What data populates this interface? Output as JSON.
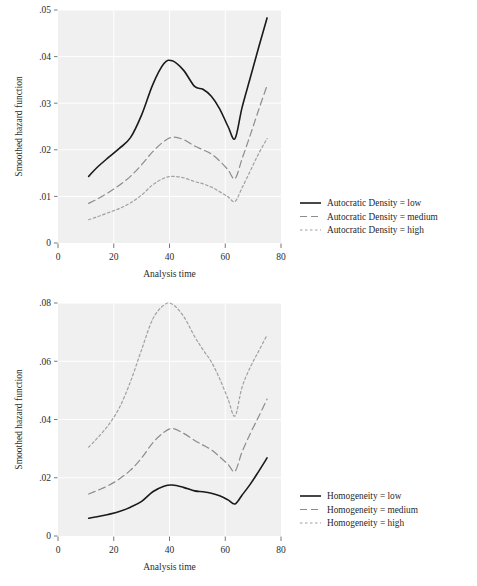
{
  "figure_top": {
    "name": "autocratic-density-hazard-chart",
    "chart_data": {
      "type": "line",
      "title": "",
      "xlabel": "Analysis time",
      "ylabel": "Smoothed hazard function",
      "xlim": [
        0,
        80
      ],
      "ylim": [
        0,
        0.05
      ],
      "xticks": [
        0,
        20,
        40,
        60,
        80
      ],
      "xtick_labels": [
        "0",
        "20",
        "40",
        "60",
        "80"
      ],
      "yticks": [
        0,
        0.01,
        0.02,
        0.03,
        0.04,
        0.05
      ],
      "ytick_labels": [
        "0",
        ".01",
        ".02",
        ".03",
        ".04",
        ".05"
      ],
      "grid": true,
      "grid_color": "#ffffff",
      "plot_background": "#f0f0f0",
      "legend_position": "right",
      "series": [
        {
          "name": "Autocratic Density = low",
          "style": "solid",
          "color": "#1a1a1a",
          "x": [
            11,
            14,
            18,
            22,
            26,
            30,
            34,
            38,
            41,
            45,
            49,
            52,
            55,
            58,
            61,
            63.5,
            66,
            69,
            72,
            75
          ],
          "values": [
            0.0143,
            0.0162,
            0.0183,
            0.0203,
            0.0226,
            0.0275,
            0.034,
            0.0385,
            0.0391,
            0.0371,
            0.0336,
            0.033,
            0.0315,
            0.0288,
            0.025,
            0.0224,
            0.029,
            0.0355,
            0.042,
            0.0483
          ]
        },
        {
          "name": "Autocratic Density = medium",
          "style": "dashed",
          "color": "#8c8c8c",
          "x": [
            11,
            14,
            18,
            22,
            26,
            30,
            34,
            38,
            41,
            45,
            49,
            52,
            55,
            58,
            61,
            63.5,
            66,
            69,
            72,
            75
          ],
          "values": [
            0.0085,
            0.0094,
            0.0108,
            0.0124,
            0.0143,
            0.0168,
            0.0196,
            0.0218,
            0.0227,
            0.0222,
            0.0208,
            0.02,
            0.0191,
            0.0176,
            0.0157,
            0.0138,
            0.018,
            0.0232,
            0.0286,
            0.0338
          ]
        },
        {
          "name": "Autocratic Density = high",
          "style": "dotted",
          "color": "#a0a0a0",
          "x": [
            11,
            14,
            18,
            22,
            26,
            30,
            34,
            38,
            41,
            45,
            49,
            52,
            55,
            58,
            61,
            63.5,
            66,
            69,
            72,
            75
          ],
          "values": [
            0.005,
            0.0056,
            0.0065,
            0.0074,
            0.0086,
            0.0103,
            0.0125,
            0.0139,
            0.0143,
            0.014,
            0.0132,
            0.0127,
            0.012,
            0.011,
            0.0099,
            0.0089,
            0.0118,
            0.0155,
            0.0192,
            0.0224
          ]
        }
      ]
    }
  },
  "figure_bottom": {
    "name": "homogeneity-hazard-chart",
    "chart_data": {
      "type": "line",
      "title": "",
      "xlabel": "Analysis time",
      "ylabel": "Smoothed hazard function",
      "xlim": [
        0,
        80
      ],
      "ylim": [
        0,
        0.08
      ],
      "xticks": [
        0,
        20,
        40,
        60,
        80
      ],
      "xtick_labels": [
        "0",
        "20",
        "40",
        "60",
        "80"
      ],
      "yticks": [
        0,
        0.02,
        0.04,
        0.06,
        0.08
      ],
      "ytick_labels": [
        "0",
        ".02",
        ".04",
        ".06",
        ".08"
      ],
      "grid": true,
      "grid_color": "#ffffff",
      "plot_background": "#f0f0f0",
      "legend_position": "right",
      "series": [
        {
          "name": "Homogeneity = low",
          "style": "solid",
          "color": "#1a1a1a",
          "x": [
            11,
            14,
            18,
            22,
            26,
            30,
            34,
            38,
            41,
            45,
            49,
            52,
            55,
            58,
            61,
            63.5,
            66,
            69,
            72,
            75
          ],
          "values": [
            0.0061,
            0.0066,
            0.0074,
            0.0084,
            0.0099,
            0.0119,
            0.0152,
            0.0171,
            0.0175,
            0.0167,
            0.0155,
            0.0152,
            0.0147,
            0.0138,
            0.0124,
            0.011,
            0.014,
            0.0178,
            0.0222,
            0.0268
          ]
        },
        {
          "name": "Homogeneity = medium",
          "style": "dashed",
          "color": "#8c8c8c",
          "x": [
            11,
            14,
            18,
            22,
            26,
            30,
            34,
            38,
            41,
            45,
            49,
            52,
            55,
            58,
            61,
            63.5,
            66,
            69,
            72,
            75
          ],
          "values": [
            0.0144,
            0.0156,
            0.0173,
            0.0196,
            0.0226,
            0.0268,
            0.032,
            0.0356,
            0.0369,
            0.0353,
            0.0328,
            0.0312,
            0.0296,
            0.0272,
            0.0246,
            0.0222,
            0.0288,
            0.0352,
            0.041,
            0.047
          ]
        },
        {
          "name": "Homogeneity = high",
          "style": "dotted",
          "color": "#a0a0a0",
          "x": [
            11,
            14,
            18,
            22,
            26,
            30,
            34,
            38,
            41,
            45,
            49,
            52,
            55,
            58,
            61,
            63.5,
            66,
            69,
            72,
            75
          ],
          "values": [
            0.0305,
            0.0335,
            0.038,
            0.044,
            0.053,
            0.064,
            0.0745,
            0.0793,
            0.0796,
            0.0755,
            0.0685,
            0.064,
            0.0598,
            0.054,
            0.047,
            0.0412,
            0.051,
            0.058,
            0.0635,
            0.069
          ]
        }
      ]
    }
  }
}
